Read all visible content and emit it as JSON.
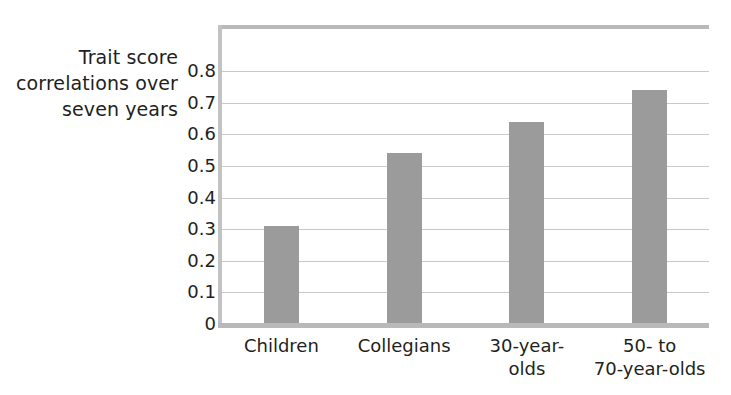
{
  "chart_data": {
    "type": "bar",
    "title": "",
    "subtitle": "",
    "xlabel": "",
    "ylabel": "Trait score correlations over seven years",
    "ylabel_lines": [
      "Trait score",
      "correlations over",
      "seven years"
    ],
    "categories": [
      "Children",
      "Collegians",
      "30-year-olds",
      "50- to 70-year-olds"
    ],
    "category_label_lines": [
      [
        "Children"
      ],
      [
        "Collegians"
      ],
      [
        "30-year-",
        "olds"
      ],
      [
        "50- to",
        "70-year-olds"
      ]
    ],
    "values": [
      0.31,
      0.54,
      0.64,
      0.74
    ],
    "ylim": [
      0,
      0.8
    ],
    "ytick_labels": [
      "0.8",
      "0.7",
      "0.6",
      "0.5",
      "0.4",
      "0.3",
      "0.2",
      "0.1",
      "0"
    ],
    "ytick_values": [
      0.8,
      0.7,
      0.6,
      0.5,
      0.4,
      0.3,
      0.2,
      0.1,
      0
    ],
    "grid": true,
    "grid_axis": "y",
    "legend": "none",
    "colors": {
      "bar": "#9b9b9b",
      "gridline": "#c9c9c9",
      "axis": "#b9b9b9",
      "text": "#231f20",
      "background": "#ffffff"
    }
  }
}
